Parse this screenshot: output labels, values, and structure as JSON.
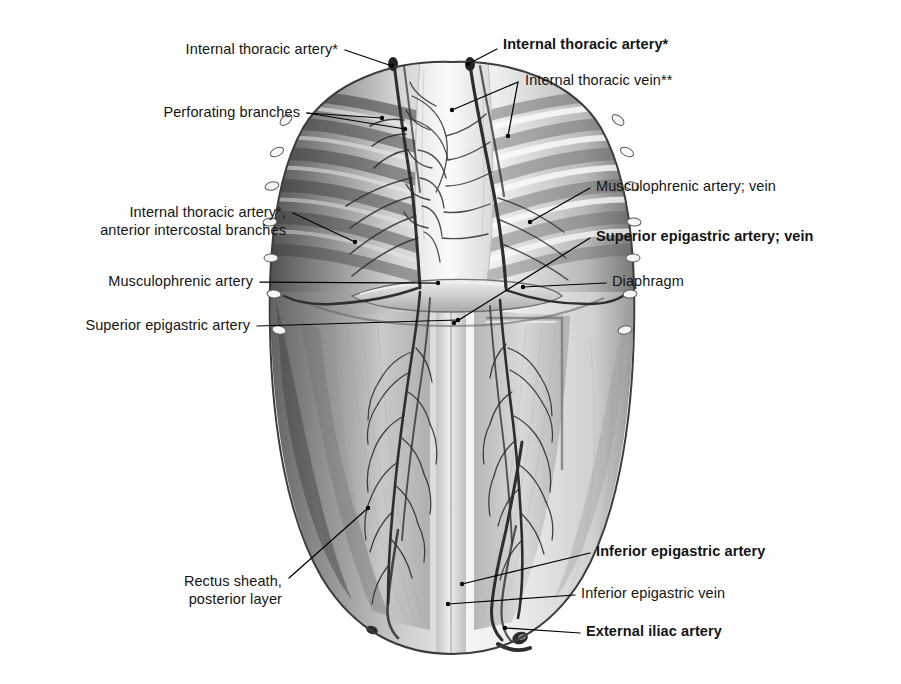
{
  "figure": {
    "kind": "anatomical-illustration",
    "view": "posterior (internal) view of the anterior body wall",
    "background_color": "#ffffff",
    "ink_color": "#141414",
    "leader_line_color": "#000000"
  },
  "labels": [
    {
      "id": "internal-thoracic-artery-left",
      "text": "Internal thoracic artery*",
      "bold": false,
      "side": "left",
      "align": "right",
      "x": 338,
      "y": 40,
      "leader": [
        [
          345,
          50
        ],
        [
          392,
          66
        ]
      ]
    },
    {
      "id": "perforating-branches",
      "text": "Perforating branches",
      "bold": false,
      "side": "left",
      "align": "right",
      "x": 300,
      "y": 103,
      "leader": [
        [
          307,
          113
        ],
        [
          405,
          129
        ],
        [
          382,
          118
        ]
      ]
    },
    {
      "id": "internal-thoracic-artery-anterior-intercostal-branches",
      "text": "Internal thoracic artery*,\nanterior intercostal branches",
      "bold": false,
      "side": "left",
      "align": "right",
      "x": 286,
      "y": 203,
      "leader": [
        [
          293,
          213
        ],
        [
          355,
          242
        ]
      ]
    },
    {
      "id": "musculophrenic-artery-left",
      "text": "Musculophrenic artery",
      "bold": false,
      "side": "left",
      "align": "right",
      "x": 253,
      "y": 272,
      "leader": [
        [
          260,
          282
        ],
        [
          438,
          283
        ]
      ]
    },
    {
      "id": "superior-epigastric-artery-left",
      "text": "Superior epigastric artery",
      "bold": false,
      "side": "left",
      "align": "right",
      "x": 250,
      "y": 316,
      "leader": [
        [
          257,
          326
        ],
        [
          458,
          320
        ]
      ]
    },
    {
      "id": "rectus-sheath-posterior-layer",
      "text": "Rectus sheath,\nposterior layer",
      "bold": false,
      "side": "left",
      "align": "right",
      "x": 282,
      "y": 572,
      "leader": [
        [
          289,
          578
        ],
        [
          368,
          508
        ]
      ]
    },
    {
      "id": "internal-thoracic-artery-right",
      "text": "Internal thoracic artery*",
      "bold": true,
      "side": "right",
      "align": "left",
      "x": 503,
      "y": 35,
      "leader": [
        [
          497,
          49
        ],
        [
          468,
          64
        ]
      ]
    },
    {
      "id": "internal-thoracic-vein",
      "text": "Internal thoracic vein**",
      "bold": false,
      "side": "right",
      "align": "left",
      "x": 525,
      "y": 71,
      "leader": [
        [
          518,
          82
        ],
        [
          452,
          110
        ],
        [
          508,
          136
        ]
      ]
    },
    {
      "id": "musculophrenic-artery-vein",
      "text": "Musculophrenic artery; vein",
      "bold": false,
      "side": "right",
      "align": "left",
      "x": 596,
      "y": 177,
      "leader": [
        [
          590,
          188
        ],
        [
          530,
          222
        ]
      ]
    },
    {
      "id": "superior-epigastric-artery-vein",
      "text": "Superior epigastric artery; vein",
      "bold": true,
      "side": "right",
      "align": "left",
      "x": 596,
      "y": 227,
      "leader": [
        [
          590,
          238
        ],
        [
          454,
          323
        ]
      ]
    },
    {
      "id": "diaphragm",
      "text": "Diaphragm",
      "bold": false,
      "side": "right",
      "align": "left",
      "x": 612,
      "y": 272,
      "leader": [
        [
          606,
          283
        ],
        [
          523,
          287
        ]
      ]
    },
    {
      "id": "inferior-epigastric-artery",
      "text": "Inferior epigastric artery",
      "bold": true,
      "side": "right",
      "align": "left",
      "x": 596,
      "y": 542,
      "leader": [
        [
          590,
          553
        ],
        [
          462,
          584
        ]
      ]
    },
    {
      "id": "inferior-epigastric-vein",
      "text": "Inferior epigastric vein",
      "bold": false,
      "side": "right",
      "align": "left",
      "x": 581,
      "y": 584,
      "leader": [
        [
          575,
          595
        ],
        [
          448,
          604
        ]
      ]
    },
    {
      "id": "external-iliac-artery",
      "text": "External iliac artery",
      "bold": true,
      "side": "right",
      "align": "left",
      "x": 586,
      "y": 622,
      "leader": [
        [
          580,
          633
        ],
        [
          505,
          628
        ]
      ]
    }
  ],
  "footnotes": {
    "single_asterisk": "*",
    "double_asterisk": "**"
  },
  "anatomy_parts": [
    "rib cage (costal cartilages and ribs)",
    "sternum, posterior surface",
    "internal thoracic artery and vein",
    "anterior intercostal branches",
    "perforating branches",
    "musculophrenic artery and vein",
    "superior epigastric artery and vein",
    "diaphragm",
    "rectus sheath, posterior layer",
    "arcuate line",
    "inferior epigastric artery and vein",
    "external iliac artery"
  ]
}
